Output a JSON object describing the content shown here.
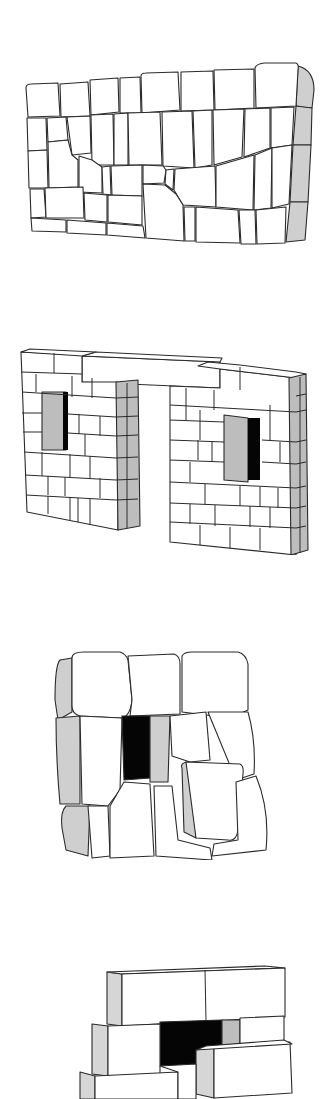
{
  "figures": [
    {
      "id": "fig1",
      "subject": "irregular polygonal stone wall",
      "shade_color": "#cfcfcf"
    },
    {
      "id": "fig2",
      "subject": "rectangular block wall with two window openings and lintel doorway",
      "shade_color": "#bdbdbd"
    },
    {
      "id": "fig3",
      "subject": "rounded stone blocks with dark recessed opening",
      "shade_color": "#cfcfcf",
      "opening_color": "#050505"
    },
    {
      "id": "fig4",
      "subject": "rectangular ashlar blocks with dark opening",
      "shade_color": "#d6d6d6",
      "opening_color": "#050505"
    }
  ],
  "colors": {
    "line": "#2a2a2a",
    "background": "#ffffff"
  }
}
